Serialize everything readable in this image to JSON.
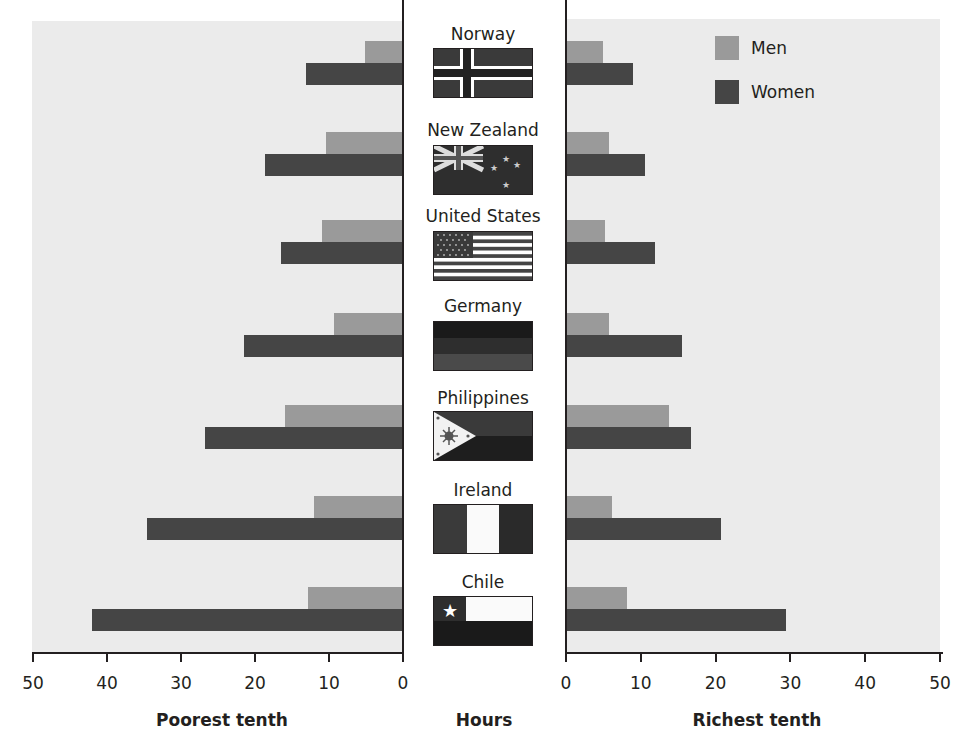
{
  "chart_data": {
    "type": "bar",
    "orientation": "horizontal-mirrored",
    "title": "",
    "categories": [
      "Norway",
      "New Zealand",
      "United States",
      "Germany",
      "Philippines",
      "Ireland",
      "Chile"
    ],
    "panels": [
      {
        "name": "Poorest tenth",
        "xlabel": "Poorest tenth",
        "direction": "leftward",
        "xlim": [
          0,
          50
        ],
        "ticks": [
          50,
          40,
          30,
          20,
          10,
          0
        ],
        "series": [
          {
            "name": "Men",
            "values": [
              5.1,
              10.4,
              11.0,
              9.3,
              15.9,
              12.0,
              12.8
            ]
          },
          {
            "name": "Women",
            "values": [
              13.1,
              18.6,
              16.5,
              21.5,
              26.7,
              34.6,
              42.0
            ]
          }
        ]
      },
      {
        "name": "Richest tenth",
        "xlabel": "Richest tenth",
        "direction": "rightward",
        "xlim": [
          0,
          50
        ],
        "ticks": [
          0,
          10,
          20,
          30,
          40,
          50
        ],
        "series": [
          {
            "name": "Men",
            "values": [
              5.0,
              5.8,
              5.2,
              5.7,
              13.8,
              6.1,
              8.2
            ]
          },
          {
            "name": "Women",
            "values": [
              8.9,
              10.6,
              11.9,
              15.5,
              16.7,
              20.7,
              29.4
            ]
          }
        ]
      }
    ],
    "center_label": "Hours",
    "legend": [
      {
        "name": "Men",
        "color": "#9a9a9a"
      },
      {
        "name": "Women",
        "color": "#454545"
      }
    ],
    "legend_position": "top-right",
    "grid": false
  },
  "labels": {
    "left_axis_title": "Poorest tenth",
    "center_axis_title": "Hours",
    "right_axis_title": "Richest tenth",
    "legend_men": "Men",
    "legend_women": "Women"
  },
  "countries": [
    {
      "name": "Norway",
      "flag": "norway-flag"
    },
    {
      "name": "New Zealand",
      "flag": "new-zealand-flag"
    },
    {
      "name": "United States",
      "flag": "united-states-flag"
    },
    {
      "name": "Germany",
      "flag": "germany-flag"
    },
    {
      "name": "Philippines",
      "flag": "philippines-flag"
    },
    {
      "name": "Ireland",
      "flag": "ireland-flag"
    },
    {
      "name": "Chile",
      "flag": "chile-flag"
    }
  ],
  "colors": {
    "men": "#9a9a9a",
    "women": "#454545",
    "panel_bg": "#ebebeb"
  }
}
